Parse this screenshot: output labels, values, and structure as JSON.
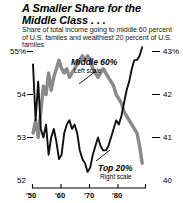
{
  "header": {
    "title": "A Smaller Share for the Middle Class . . .",
    "subtitle": "Share of total income going to middle 60 percent of U.S. familes and wealthiest 20 percent of U.S. familes"
  },
  "annotations": {
    "middle_label": "Middle 60%",
    "middle_scale": "Left scale",
    "top_label": "Top 20%",
    "top_scale": "Right scale"
  },
  "axes": {
    "left_ticks": [
      "55%",
      "54",
      "53",
      "52"
    ],
    "right_ticks": [
      "43%",
      "42",
      "41",
      "40"
    ],
    "x_ticks": [
      "'50",
      "'60",
      "'70",
      "'80"
    ]
  },
  "colors": {
    "middle_series": "#8a8a8a",
    "top_series": "#111111",
    "background": "#ffffff",
    "text": "#000000"
  },
  "chart_data": {
    "type": "line",
    "title": "A Smaller Share for the Middle Class . . .",
    "subtitle": "Share of total income going to middle 60 percent of U.S. familes and wealthiest 20 percent of U.S. familes",
    "xlabel": "",
    "ylabel": "Percent of total income",
    "grid": false,
    "legend": "annotated-inline",
    "x": [
      1947,
      1948,
      1949,
      1950,
      1951,
      1952,
      1953,
      1954,
      1955,
      1956,
      1957,
      1958,
      1959,
      1960,
      1961,
      1962,
      1963,
      1964,
      1965,
      1966,
      1967,
      1968,
      1969,
      1970,
      1971,
      1972,
      1973,
      1974,
      1975,
      1976,
      1977,
      1978,
      1979,
      1980,
      1981,
      1982,
      1983,
      1984,
      1985,
      1986,
      1987,
      1988,
      1989
    ],
    "x_tick_values": [
      1950,
      1960,
      1970,
      1980
    ],
    "x_tick_labels": [
      "'50",
      "'60",
      "'70",
      "'80"
    ],
    "series": [
      {
        "name": "Middle 60%",
        "axis": "left",
        "color": "#8a8a8a",
        "ylim": [
          52,
          55
        ],
        "y_ticks": [
          52,
          53,
          54,
          55
        ],
        "y_tick_labels": [
          "52",
          "53",
          "54",
          "55%"
        ],
        "values": [
          53.1,
          53.4,
          53.0,
          53.6,
          54.2,
          54.0,
          54.5,
          54.1,
          54.4,
          54.6,
          54.8,
          54.6,
          54.5,
          54.6,
          54.4,
          54.5,
          54.6,
          54.7,
          54.8,
          54.9,
          54.8,
          54.9,
          54.8,
          54.6,
          54.5,
          54.4,
          54.5,
          54.6,
          54.5,
          54.4,
          54.3,
          54.2,
          54.0,
          53.9,
          53.8,
          53.6,
          53.5,
          53.4,
          53.3,
          53.2,
          53.1,
          52.8,
          52.4
        ]
      },
      {
        "name": "Top 20%",
        "axis": "right",
        "color": "#111111",
        "ylim": [
          40,
          43
        ],
        "y_ticks": [
          40,
          41,
          42,
          43
        ],
        "y_tick_labels": [
          "40",
          "41",
          "42",
          "43%"
        ],
        "values": [
          42.7,
          41.4,
          42.3,
          41.2,
          41.0,
          41.3,
          40.6,
          41.0,
          41.2,
          40.9,
          40.5,
          40.6,
          41.1,
          41.3,
          41.4,
          41.2,
          41.3,
          41.1,
          40.7,
          40.5,
          40.4,
          40.2,
          40.3,
          40.6,
          40.8,
          41.0,
          40.8,
          40.7,
          40.7,
          40.8,
          41.0,
          41.2,
          41.4,
          41.3,
          41.5,
          41.8,
          42.1,
          42.3,
          42.6,
          42.8,
          42.8,
          42.9,
          43.1
        ]
      }
    ]
  }
}
